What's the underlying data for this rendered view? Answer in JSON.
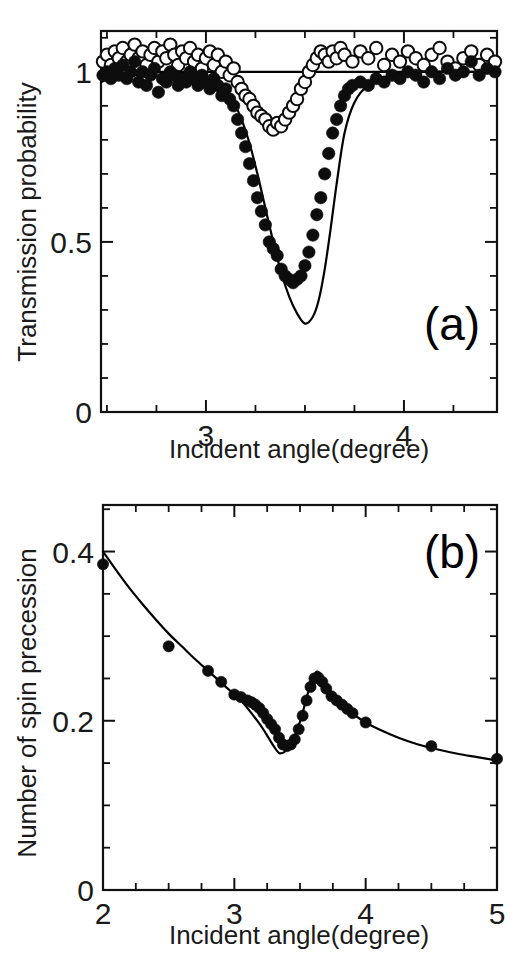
{
  "figure": {
    "panels": [
      "a",
      "b"
    ]
  },
  "chart_data": [
    {
      "panel_tag": "(a)",
      "type": "scatter",
      "title": "",
      "xlabel": "Incident angle(degree)",
      "ylabel": "Transmission probability",
      "xlim": [
        2.47,
        4.47
      ],
      "ylim": [
        0,
        1.12
      ],
      "xticks": [
        3,
        4
      ],
      "xtick_labels": [
        "3",
        "4"
      ],
      "xtick_minor_step": 0.25,
      "yticks": [
        0,
        0.5,
        1
      ],
      "ytick_labels": [
        "0",
        "0.5",
        "1"
      ],
      "ytick_minor_step": 0.1,
      "grid": false,
      "legend": "none",
      "series": [
        {
          "name": "open-circles",
          "marker": "open-circle",
          "x": [
            2.48,
            2.5,
            2.52,
            2.54,
            2.56,
            2.58,
            2.6,
            2.62,
            2.64,
            2.66,
            2.68,
            2.7,
            2.72,
            2.74,
            2.76,
            2.78,
            2.8,
            2.82,
            2.84,
            2.86,
            2.88,
            2.9,
            2.92,
            2.94,
            2.96,
            2.98,
            3.0,
            3.02,
            3.04,
            3.06,
            3.08,
            3.1,
            3.12,
            3.14,
            3.16,
            3.18,
            3.2,
            3.22,
            3.24,
            3.26,
            3.28,
            3.3,
            3.32,
            3.34,
            3.36,
            3.38,
            3.4,
            3.42,
            3.44,
            3.46,
            3.48,
            3.5,
            3.52,
            3.54,
            3.56,
            3.58,
            3.6,
            3.62,
            3.64,
            3.66,
            3.68,
            3.7,
            3.74,
            3.78,
            3.82,
            3.86,
            3.9,
            3.94,
            3.98,
            4.02,
            4.06,
            4.1,
            4.14,
            4.18,
            4.22,
            4.26,
            4.3,
            4.34,
            4.38,
            4.42,
            4.46
          ],
          "y": [
            1.03,
            1.05,
            1.02,
            1.06,
            1.04,
            1.07,
            1.03,
            1.05,
            1.08,
            1.04,
            1.06,
            1.02,
            1.05,
            1.07,
            1.03,
            1.06,
            1.04,
            1.08,
            1.05,
            1.02,
            1.06,
            1.04,
            1.07,
            1.03,
            1.05,
            1.01,
            1.04,
            1.06,
            1.02,
            1.05,
            1.0,
            1.03,
            0.99,
            1.01,
            0.97,
            0.95,
            0.93,
            0.92,
            0.9,
            0.88,
            0.87,
            0.86,
            0.84,
            0.83,
            0.85,
            0.84,
            0.86,
            0.88,
            0.9,
            0.92,
            0.95,
            0.97,
            1.0,
            1.02,
            1.04,
            1.06,
            1.05,
            1.03,
            1.06,
            1.04,
            1.07,
            1.05,
            1.03,
            1.06,
            1.04,
            1.07,
            1.02,
            1.05,
            1.03,
            1.06,
            1.04,
            1.02,
            1.05,
            1.07,
            1.03,
            1.01,
            1.04,
            1.06,
            1.02,
            1.05,
            1.03
          ]
        },
        {
          "name": "filled-circles",
          "marker": "filled-circle",
          "x": [
            2.48,
            2.5,
            2.52,
            2.54,
            2.56,
            2.58,
            2.6,
            2.62,
            2.64,
            2.66,
            2.68,
            2.7,
            2.72,
            2.74,
            2.76,
            2.78,
            2.8,
            2.82,
            2.84,
            2.86,
            2.88,
            2.9,
            2.92,
            2.94,
            2.96,
            2.98,
            3.0,
            3.02,
            3.04,
            3.06,
            3.08,
            3.1,
            3.12,
            3.14,
            3.16,
            3.18,
            3.2,
            3.22,
            3.24,
            3.26,
            3.28,
            3.3,
            3.32,
            3.34,
            3.36,
            3.38,
            3.4,
            3.42,
            3.44,
            3.46,
            3.48,
            3.5,
            3.52,
            3.54,
            3.56,
            3.58,
            3.6,
            3.62,
            3.64,
            3.66,
            3.68,
            3.7,
            3.72,
            3.74,
            3.78,
            3.82,
            3.86,
            3.9,
            3.94,
            3.98,
            4.02,
            4.06,
            4.1,
            4.14,
            4.18,
            4.22,
            4.26,
            4.3,
            4.34,
            4.38,
            4.42,
            4.46
          ],
          "y": [
            0.99,
            1.0,
            0.98,
            1.01,
            0.99,
            1.02,
            0.98,
            1.0,
            1.03,
            0.97,
            1.0,
            0.96,
            0.99,
            1.01,
            0.94,
            0.98,
            0.97,
            1.0,
            0.99,
            0.96,
            0.98,
            0.97,
            1.0,
            0.98,
            0.96,
            0.99,
            0.97,
            0.95,
            0.98,
            0.96,
            0.93,
            0.95,
            0.92,
            0.9,
            0.86,
            0.82,
            0.78,
            0.73,
            0.68,
            0.63,
            0.59,
            0.55,
            0.5,
            0.48,
            0.46,
            0.42,
            0.4,
            0.39,
            0.38,
            0.39,
            0.4,
            0.43,
            0.47,
            0.52,
            0.58,
            0.63,
            0.7,
            0.76,
            0.82,
            0.86,
            0.9,
            0.93,
            0.95,
            0.96,
            0.97,
            0.96,
            0.98,
            0.97,
            0.99,
            0.98,
            1.0,
            0.99,
            0.97,
            1.0,
            0.98,
            1.01,
            0.99,
            1.0,
            1.03,
            0.99,
            1.01,
            1.0
          ]
        }
      ],
      "model_curves": [
        {
          "name": "broad-baseline",
          "x": [
            2.47,
            2.55,
            2.65,
            2.75,
            2.85,
            2.95,
            3.05,
            3.15,
            3.25,
            3.35,
            3.45,
            3.55,
            3.65,
            3.75,
            3.85,
            3.95,
            4.05,
            4.15,
            4.25,
            4.35,
            4.47
          ],
          "y": [
            0.97,
            0.99,
            1.0,
            1.0,
            1.0,
            1.0,
            1.0,
            1.0,
            1.0,
            1.0,
            1.0,
            1.0,
            1.0,
            1.0,
            1.0,
            1.0,
            1.0,
            1.0,
            1.0,
            1.0,
            1.0
          ]
        },
        {
          "name": "deep-dip-fit",
          "x": [
            2.47,
            2.7,
            2.9,
            3.0,
            3.05,
            3.1,
            3.14,
            3.18,
            3.22,
            3.26,
            3.3,
            3.34,
            3.38,
            3.42,
            3.46,
            3.5,
            3.54,
            3.57,
            3.6,
            3.63,
            3.66,
            3.7,
            3.75,
            3.82,
            3.95,
            4.1,
            4.3,
            4.47
          ],
          "y": [
            0.99,
            0.99,
            0.98,
            0.97,
            0.96,
            0.94,
            0.91,
            0.86,
            0.79,
            0.7,
            0.6,
            0.5,
            0.41,
            0.34,
            0.29,
            0.26,
            0.28,
            0.33,
            0.42,
            0.54,
            0.67,
            0.82,
            0.91,
            0.96,
            0.99,
            1.0,
            1.0,
            1.0
          ]
        }
      ]
    },
    {
      "panel_tag": "(b)",
      "type": "scatter",
      "title": "",
      "xlabel": "Incident angle(degree)",
      "ylabel": "Number of spin precession",
      "xlim": [
        2,
        5
      ],
      "ylim": [
        0,
        0.455
      ],
      "xticks": [
        2,
        3,
        4,
        5
      ],
      "xtick_labels": [
        "2",
        "3",
        "4",
        "5"
      ],
      "xtick_minor_step": 0.25,
      "yticks": [
        0,
        0.2,
        0.4
      ],
      "ytick_labels": [
        "0",
        "0.2",
        "0.4"
      ],
      "ytick_minor_step": 0.05,
      "grid": false,
      "legend": "none",
      "series": [
        {
          "name": "filled-circles",
          "marker": "filled-circle",
          "x": [
            2.0,
            2.5,
            2.8,
            2.9,
            3.0,
            3.05,
            3.1,
            3.13,
            3.16,
            3.19,
            3.22,
            3.25,
            3.28,
            3.31,
            3.34,
            3.37,
            3.4,
            3.43,
            3.46,
            3.49,
            3.52,
            3.55,
            3.58,
            3.61,
            3.64,
            3.67,
            3.7,
            3.74,
            3.78,
            3.82,
            3.86,
            3.9,
            4.0,
            4.5,
            5.0
          ],
          "y": [
            0.385,
            0.288,
            0.259,
            0.246,
            0.231,
            0.228,
            0.224,
            0.222,
            0.219,
            0.215,
            0.209,
            0.202,
            0.196,
            0.19,
            0.18,
            0.172,
            0.17,
            0.172,
            0.178,
            0.19,
            0.206,
            0.224,
            0.24,
            0.25,
            0.251,
            0.246,
            0.238,
            0.229,
            0.224,
            0.219,
            0.214,
            0.209,
            0.198,
            0.17,
            0.155
          ]
        }
      ],
      "model_curves": [
        {
          "name": "theory-fit",
          "x": [
            2.0,
            2.1,
            2.2,
            2.3,
            2.4,
            2.5,
            2.6,
            2.7,
            2.8,
            2.9,
            3.0,
            3.05,
            3.1,
            3.14,
            3.18,
            3.22,
            3.26,
            3.3,
            3.34,
            3.38,
            3.42,
            3.46,
            3.5,
            3.54,
            3.57,
            3.6,
            3.63,
            3.66,
            3.7,
            3.75,
            3.8,
            3.85,
            3.9,
            4.0,
            4.1,
            4.25,
            4.4,
            4.55,
            4.7,
            4.85,
            5.0
          ],
          "y": [
            0.4,
            0.378,
            0.357,
            0.338,
            0.32,
            0.303,
            0.288,
            0.273,
            0.259,
            0.245,
            0.231,
            0.224,
            0.215,
            0.207,
            0.199,
            0.19,
            0.18,
            0.17,
            0.162,
            0.163,
            0.17,
            0.182,
            0.199,
            0.221,
            0.238,
            0.252,
            0.258,
            0.254,
            0.24,
            0.227,
            0.219,
            0.213,
            0.208,
            0.198,
            0.19,
            0.18,
            0.172,
            0.166,
            0.161,
            0.157,
            0.153
          ]
        }
      ]
    }
  ]
}
